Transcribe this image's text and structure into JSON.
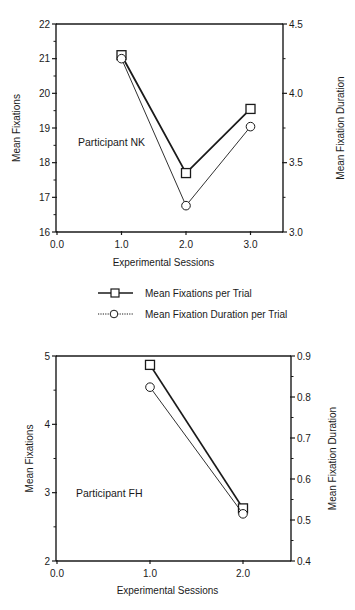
{
  "chart_data": [
    {
      "type": "line",
      "annotation": "Participant NK",
      "xlabel": "Experimental Sessions",
      "ylabel": "Mean Fixations",
      "ylabel_right": "Mean Fixation Duration",
      "x_ticks": [
        "0.0",
        "1.0",
        "2.0",
        "3.0"
      ],
      "xlim": [
        0,
        3.5
      ],
      "ylim": [
        16,
        22
      ],
      "y_ticks": [
        "16",
        "17",
        "18",
        "19",
        "20",
        "21",
        "22"
      ],
      "ylim_right": [
        3.0,
        4.5
      ],
      "y_ticks_right": [
        "3.0",
        "3.5",
        "4.0",
        "4.5"
      ],
      "grid": false,
      "series": [
        {
          "name": "Mean Fixations per Trial",
          "axis": "left",
          "marker": "square",
          "line": "solid",
          "x": [
            1,
            2,
            3
          ],
          "values": [
            21.1,
            17.7,
            19.55
          ]
        },
        {
          "name": "Mean Fixation Duration per Trial",
          "axis": "right",
          "marker": "circle",
          "line": "dotted",
          "x": [
            1,
            2,
            3
          ],
          "values": [
            4.25,
            3.19,
            3.76
          ]
        }
      ]
    },
    {
      "type": "line",
      "annotation": "Participant FH",
      "xlabel": "Experimental Sessions",
      "ylabel": "Mean Fixations",
      "ylabel_right": "Mean Fixation Duration",
      "x_ticks": [
        "0.0",
        "1.0",
        "2.0"
      ],
      "xlim": [
        0,
        2.5
      ],
      "ylim": [
        2,
        5
      ],
      "y_ticks": [
        "2",
        "3",
        "4",
        "5"
      ],
      "ylim_right": [
        0.4,
        0.9
      ],
      "y_ticks_right": [
        "0.4",
        "0.5",
        "0.6",
        "0.7",
        "0.8",
        "0.9"
      ],
      "grid": false,
      "series": [
        {
          "name": "Mean Fixations per Trial",
          "axis": "left",
          "marker": "square",
          "line": "solid",
          "x": [
            1,
            2
          ],
          "values": [
            4.87,
            2.77
          ]
        },
        {
          "name": "Mean Fixation Duration per Trial",
          "axis": "right",
          "marker": "circle",
          "line": "dotted",
          "x": [
            1,
            2
          ],
          "values": [
            0.824,
            0.515
          ]
        }
      ]
    }
  ],
  "legend": {
    "position": "between charts",
    "entries": [
      {
        "label": "Mean Fixations per Trial",
        "marker": "square",
        "line": "solid"
      },
      {
        "label": "Mean Fixation Duration per Trial",
        "marker": "circle",
        "line": "dotted"
      }
    ]
  },
  "colors": {
    "ink": "#1a1a1a",
    "background": "#ffffff"
  }
}
